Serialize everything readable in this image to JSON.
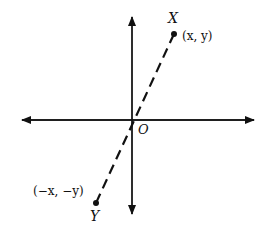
{
  "diagram": {
    "type": "coordinate-plane",
    "axes": {
      "horizontal": "double-arrow",
      "vertical": "double-arrow"
    },
    "origin_label": "O",
    "points": [
      {
        "name": "X",
        "coords_label": "(x, y)"
      },
      {
        "name": "Y",
        "coords_label": "(−x, −y)"
      }
    ],
    "segment": {
      "from": "X",
      "to": "Y",
      "style": "dashed",
      "through": "O"
    },
    "colors": {
      "ink": "#111111",
      "background": "#ffffff"
    }
  }
}
